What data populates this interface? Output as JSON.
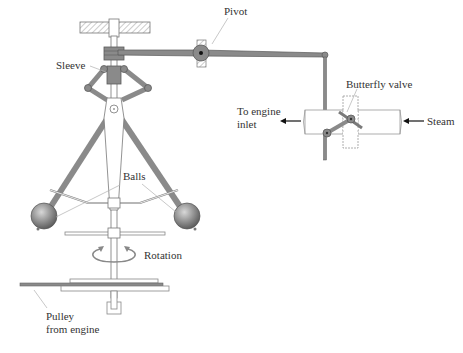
{
  "figure": {
    "labels": {
      "pivot": "Pivot",
      "sleeve": "Sleeve",
      "butterfly_valve": "Butterfly valve",
      "to_engine_inlet_line1": "To engine",
      "to_engine_inlet_line2": "inlet",
      "steam": "Steam",
      "balls": "Balls",
      "rotation": "Rotation",
      "pulley_line1": "Pulley",
      "pulley_line2": "from engine"
    },
    "colors": {
      "background": "#ffffff",
      "link_fill": "#8a8a8a",
      "link_stroke": "#5a5a5a",
      "outline": "#777777",
      "hatch": "#9a9a9a",
      "leader": "#b0b0b0",
      "text": "#333333",
      "ball_light": "#d8d8d8",
      "ball_dark": "#5e5e5e"
    }
  }
}
